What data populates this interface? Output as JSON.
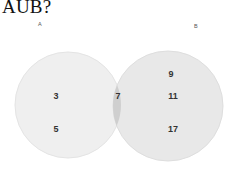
{
  "question": "AUB?",
  "venn": {
    "sets": [
      {
        "name": "A",
        "only_elements": [
          "3",
          "5"
        ],
        "color": "#ececec"
      },
      {
        "name": "B",
        "only_elements": [
          "9",
          "11",
          "17"
        ],
        "color": "#e6e6e6"
      }
    ],
    "intersection": [
      "7"
    ],
    "intersection_color": "#c9c9c9"
  }
}
